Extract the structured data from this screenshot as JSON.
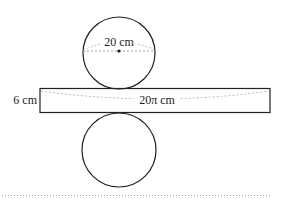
{
  "diagram": {
    "labels": {
      "diameter": "20 cm",
      "height": "6 cm",
      "circumference": "20π cm"
    },
    "colors": {
      "stroke": "#222222",
      "dash": "#888888",
      "background": "#ffffff"
    }
  }
}
